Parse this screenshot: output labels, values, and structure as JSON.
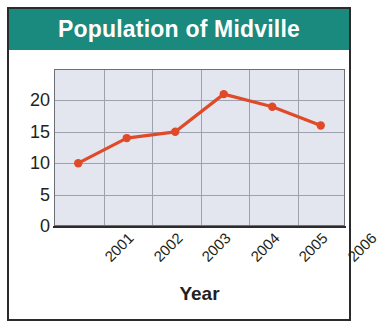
{
  "figure": {
    "title": "Population of Midville",
    "title_bar_color": "#1a8a7e",
    "title_text_color": "#ffffff",
    "border_color": "#2b2b2b",
    "background_color": "#ffffff"
  },
  "chart_data": {
    "type": "line",
    "title": "Population of Midville",
    "xlabel": "Year",
    "ylabel": "",
    "categories": [
      "2001",
      "2002",
      "2003",
      "2004",
      "2005",
      "2006"
    ],
    "values": [
      10,
      14,
      15,
      21,
      19,
      16
    ],
    "series": [
      {
        "name": "Population",
        "values": [
          10,
          14,
          15,
          21,
          19,
          16
        ],
        "color": "#e04a28",
        "marker": "circle"
      }
    ],
    "ylim": [
      0,
      25
    ],
    "yticks": [
      0,
      5,
      10,
      15,
      20
    ],
    "ytick_labels": [
      "0",
      "5",
      "10",
      "15",
      "20"
    ],
    "xtick_labels": [
      "2001",
      "2002",
      "2003",
      "2004",
      "2005",
      "2006"
    ],
    "xtick_rotation": -45,
    "grid": true,
    "grid_color": "#9ea2ae",
    "plot_background": "#e3e6ef",
    "legend": null,
    "legend_position": "none"
  }
}
